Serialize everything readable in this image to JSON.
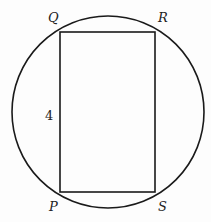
{
  "diagram": {
    "type": "geometry",
    "circle": {
      "cx": 108,
      "cy": 112,
      "r": 96
    },
    "rectangle": {
      "vertices": {
        "Q": [
          60,
          32
        ],
        "R": [
          155,
          32
        ],
        "S": [
          155,
          192
        ],
        "P": [
          60,
          192
        ]
      }
    },
    "labels": {
      "Q": "Q",
      "R": "R",
      "S": "S",
      "P": "P",
      "side_PQ": "4"
    },
    "stroke_color": "#1a1a1a"
  }
}
